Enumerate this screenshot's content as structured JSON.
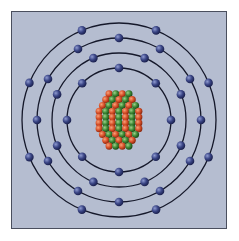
{
  "diagram": {
    "type": "bohr-atom-model",
    "colors": {
      "background": "#b5bdd0",
      "frame_border": "#4a4f5e",
      "orbit": "#15182a",
      "electron": "#3a4585",
      "proton": "#d8512a",
      "neutron": "#3e8a36"
    },
    "center": [
      119,
      120
    ],
    "shells": [
      {
        "name": "shell-1",
        "radius": 52,
        "electrons": 8
      },
      {
        "name": "shell-2",
        "radius": 67,
        "electrons": 8
      },
      {
        "name": "shell-3",
        "radius": 82,
        "electrons": 12
      },
      {
        "name": "shell-4",
        "radius": 97,
        "electrons": 8
      }
    ],
    "nucleus": {
      "description": "cluster of red protons and green neutrons"
    }
  }
}
